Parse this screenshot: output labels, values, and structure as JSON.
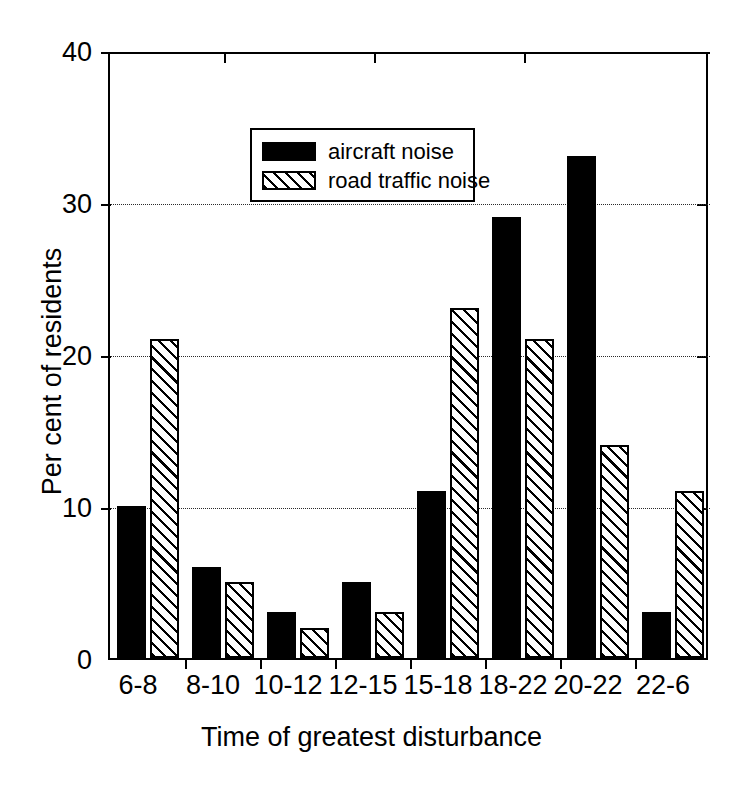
{
  "chart_data": {
    "type": "bar",
    "title": "",
    "xlabel": "Time of greatest disturbance",
    "ylabel": "Per cent of residents",
    "categories": [
      "6-8",
      "8-10",
      "10-12",
      "12-15",
      "15-18",
      "18-22",
      "20-22",
      "22-6"
    ],
    "series": [
      {
        "name": "aircraft noise",
        "pattern": "solid",
        "color": "#000000",
        "values": [
          10,
          6,
          3,
          5,
          11,
          29,
          33,
          3
        ]
      },
      {
        "name": "road traffic noise",
        "pattern": "diagonal-hatch",
        "color": "#000000",
        "values": [
          21,
          5,
          2,
          3,
          23,
          21,
          14,
          11
        ]
      }
    ],
    "ylim": [
      0,
      40
    ],
    "yticks": [
      0,
      10,
      20,
      30,
      40
    ],
    "ytick_labels": [
      "0",
      "10",
      "20",
      "30",
      "40"
    ],
    "grid": "horizontal-dotted",
    "legend_position": "top-left-inside"
  },
  "legend": {
    "entries": [
      {
        "label": "aircraft noise",
        "swatch": "solid-black-swatch"
      },
      {
        "label": "road traffic noise",
        "swatch": "hatched-swatch"
      }
    ]
  }
}
